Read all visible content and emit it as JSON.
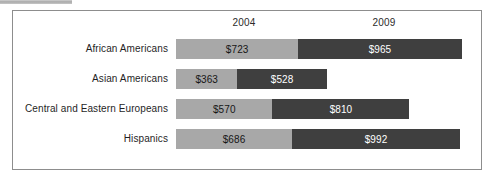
{
  "artifact": {
    "name": "scan-strip"
  },
  "chart_data": {
    "type": "bar",
    "orientation": "horizontal",
    "stacked": true,
    "title": "",
    "xlabel": "",
    "ylabel": "",
    "grid": false,
    "legend_position": "top-as-column-headers",
    "column_headers": [
      "2004",
      "2009"
    ],
    "categories": [
      "African Americans",
      "Asian Americans",
      "Central and Eastern Europeans",
      "Hispanics"
    ],
    "series": [
      {
        "name": "2004",
        "color": "#a8a8a8",
        "values": [
          723,
          363,
          570,
          686
        ],
        "labels": [
          "$723",
          "$363",
          "$570",
          "$686"
        ]
      },
      {
        "name": "2009",
        "color": "#3f3f3f",
        "values": [
          965,
          528,
          810,
          992
        ],
        "labels": [
          "$965",
          "$528",
          "$810",
          "$992"
        ]
      }
    ],
    "rows": [
      {
        "category": "African Americans",
        "v2004": 723,
        "label2004": "$723",
        "v2009": 965,
        "label2009": "$965"
      },
      {
        "category": "Asian Americans",
        "v2004": 363,
        "label2004": "$363",
        "v2009": 528,
        "label2009": "$528"
      },
      {
        "category": "Central and Eastern Europeans",
        "v2004": 570,
        "label2004": "$570",
        "v2009": 810,
        "label2009": "$810"
      },
      {
        "category": "Hispanics",
        "v2004": 686,
        "label2004": "$686",
        "v2009": 992,
        "label2009": "$992"
      }
    ],
    "scale_px_per_unit": 0.1692
  }
}
